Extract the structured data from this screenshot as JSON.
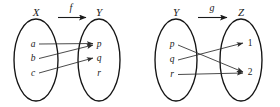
{
  "figure": {
    "type": "function-mapping-diagram",
    "background": "#ffffff",
    "stroke_color": "#141414",
    "arrow_color": "#2b2b2b",
    "panels": [
      {
        "id": "panel-f",
        "map_label": "f",
        "domain": {
          "name": "X",
          "elements": [
            {
              "label": "a"
            },
            {
              "label": "b"
            },
            {
              "label": "c"
            }
          ]
        },
        "codomain": {
          "name": "Y",
          "elements": [
            {
              "label": "p"
            },
            {
              "label": "q"
            },
            {
              "label": "r"
            }
          ]
        },
        "mappings": [
          {
            "from": "a",
            "to": "p"
          },
          {
            "from": "b",
            "to": "p"
          },
          {
            "from": "c",
            "to": "q"
          }
        ]
      },
      {
        "id": "panel-g",
        "map_label": "g",
        "domain": {
          "name": "Y",
          "elements": [
            {
              "label": "p"
            },
            {
              "label": "q"
            },
            {
              "label": "r"
            }
          ]
        },
        "codomain": {
          "name": "Z",
          "elements": [
            {
              "label": "1"
            },
            {
              "label": "2"
            }
          ]
        },
        "mappings": [
          {
            "from": "p",
            "to": "2"
          },
          {
            "from": "q",
            "to": "1"
          },
          {
            "from": "r",
            "to": "2"
          }
        ]
      }
    ]
  }
}
